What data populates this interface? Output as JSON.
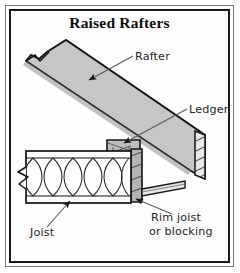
{
  "figure": {
    "title": "Raised Rafters",
    "type": "construction-detail-illustration"
  },
  "labels": {
    "rafter": "Rafter",
    "ledger": "Ledger",
    "joist": "Joist",
    "rim_joist_line1": "Rim joist",
    "rim_joist_line2": "or blocking"
  },
  "components": [
    {
      "name": "rafter",
      "label": "Rafter",
      "description": "sloped beam running upper-left to lower-right with break symbol at upper end"
    },
    {
      "name": "ledger",
      "label": "Ledger",
      "description": "hatched block supporting the rafter at its lower bearing point"
    },
    {
      "name": "joist",
      "label": "Joist",
      "description": "horizontal framing band with insulation loops, break symbol at left end"
    },
    {
      "name": "rim-joist",
      "label": "Rim joist or blocking",
      "description": "vertical hatched member closing the joist ends"
    }
  ],
  "colors": {
    "wood_fill": "#c6c6c6",
    "wood_fill_light": "#d6d6d6",
    "outline": "#141414",
    "leader": "#5a5a5a",
    "frame": "#1a1a1a",
    "outer_rule": "#7a7a7a",
    "paper": "#fdfdfd",
    "text": "#262626"
  }
}
